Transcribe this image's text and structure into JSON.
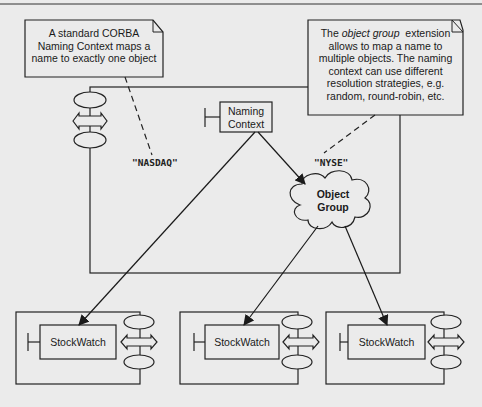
{
  "diagram": {
    "notes": {
      "corba": {
        "lines": [
          "A standard CORBA",
          "Naming Context maps a",
          "name to exactly one object"
        ]
      },
      "object_group": {
        "line1_prefix": "The ",
        "line1_italic": "object group",
        "line1_suffix": "  extension",
        "lines": [
          "allows to map a name to",
          "multiple objects. The naming",
          "context can use different",
          "resolution strategies, e.g.",
          "random, round-robin, etc."
        ]
      }
    },
    "naming_context": {
      "lines": [
        "Naming",
        "Context"
      ]
    },
    "object_group_cloud": {
      "lines": [
        "Object",
        "Group"
      ]
    },
    "bindings": {
      "nasdaq": "\"NASDAQ\"",
      "nyse": "\"NYSE\""
    },
    "servers": [
      {
        "label": "StockWatch"
      },
      {
        "label": "StockWatch"
      },
      {
        "label": "StockWatch"
      }
    ]
  }
}
